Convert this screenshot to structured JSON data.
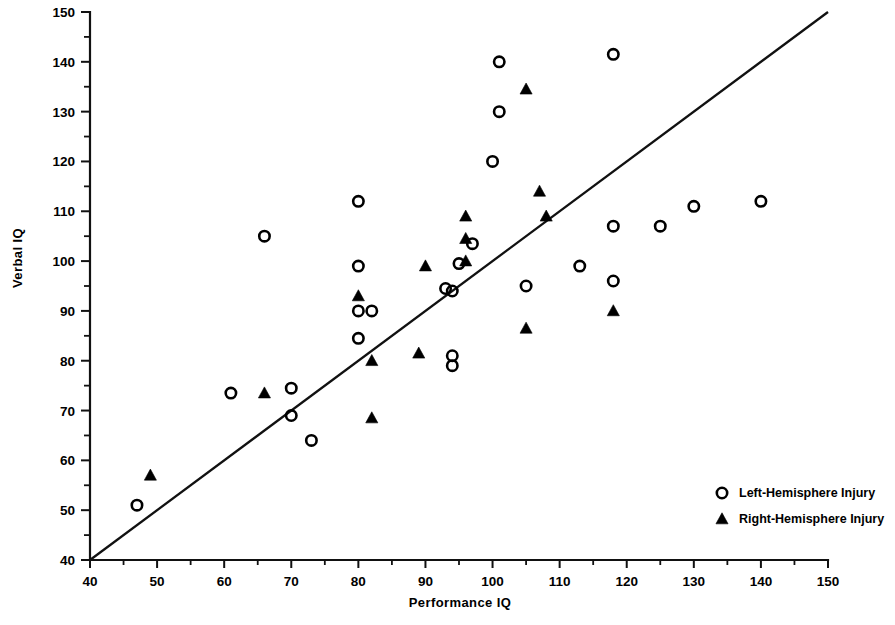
{
  "chart_data": {
    "type": "scatter",
    "title": "",
    "xlabel": "Performance  IQ",
    "ylabel": "Verbal IQ",
    "xlim": [
      40,
      150
    ],
    "ylim": [
      40,
      150
    ],
    "xticks": [
      40,
      50,
      60,
      70,
      80,
      90,
      100,
      110,
      120,
      130,
      140,
      150
    ],
    "yticks": [
      40,
      50,
      60,
      70,
      80,
      90,
      100,
      110,
      120,
      130,
      140,
      150
    ],
    "xtick_labels": [
      "40",
      "50",
      "60",
      "70",
      "80",
      "90",
      "100",
      "110",
      "120",
      "130",
      "140",
      "150"
    ],
    "ytick_labels": [
      "40",
      "50",
      "60",
      "70",
      "80",
      "90",
      "100",
      "110",
      "120",
      "130",
      "140",
      "150"
    ],
    "minor_tick_step": 5,
    "grid": false,
    "legend_position": "lower-right",
    "reference_line": {
      "name": "identity-line",
      "x": [
        40,
        150
      ],
      "y": [
        40,
        150
      ]
    },
    "series": [
      {
        "name": "Left-Hemisphere Injury",
        "marker": "open-circle",
        "color": "#000000",
        "points": [
          [
            47,
            51
          ],
          [
            61,
            73.5
          ],
          [
            66,
            105
          ],
          [
            70,
            74.5
          ],
          [
            70,
            69
          ],
          [
            73,
            64
          ],
          [
            80,
            112
          ],
          [
            80,
            99
          ],
          [
            80,
            90
          ],
          [
            80,
            84.5
          ],
          [
            82,
            90
          ],
          [
            93,
            94.5
          ],
          [
            94,
            94
          ],
          [
            94,
            81
          ],
          [
            94,
            79
          ],
          [
            95,
            99.5
          ],
          [
            97,
            103.5
          ],
          [
            100,
            120
          ],
          [
            101,
            140
          ],
          [
            101,
            130
          ],
          [
            105,
            95
          ],
          [
            113,
            99
          ],
          [
            118,
            141.5
          ],
          [
            118,
            107
          ],
          [
            118,
            96
          ],
          [
            125,
            107
          ],
          [
            130,
            111
          ],
          [
            140,
            112
          ]
        ]
      },
      {
        "name": "Right-Hemisphere Injury",
        "marker": "filled-triangle",
        "color": "#000000",
        "points": [
          [
            49,
            57
          ],
          [
            66,
            73.5
          ],
          [
            80,
            93
          ],
          [
            82,
            80
          ],
          [
            82,
            68.5
          ],
          [
            89,
            81.5
          ],
          [
            90,
            99
          ],
          [
            96,
            109
          ],
          [
            96,
            104.5
          ],
          [
            96,
            100
          ],
          [
            105,
            86.5
          ],
          [
            105,
            134.5
          ],
          [
            107,
            114
          ],
          [
            108,
            109
          ],
          [
            118,
            90
          ]
        ]
      }
    ],
    "legend": [
      {
        "marker": "open-circle",
        "label": "Left-Hemisphere Injury"
      },
      {
        "marker": "filled-triangle",
        "label": "Right-Hemisphere Injury"
      }
    ]
  }
}
